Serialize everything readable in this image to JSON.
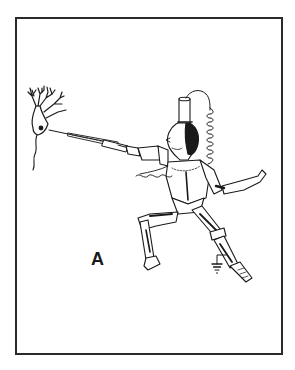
{
  "figure": {
    "panel_label": "A",
    "elements": [
      "neuron",
      "micropipette-electrode",
      "knight-figure",
      "coiled-cable",
      "ground-symbol"
    ],
    "colors": {
      "ink": "#1a1a1a",
      "background": "#ffffff",
      "frame": "#2a2a2a"
    }
  }
}
